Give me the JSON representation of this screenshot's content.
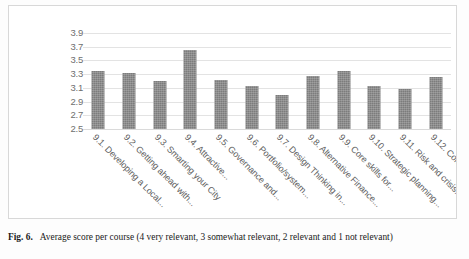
{
  "figure": {
    "caption_label": "Fig. 6.",
    "caption_text": "Average score per course (4 very relevant, 3 somewhat relevant, 2 relevant and 1 not relevant)",
    "ghost_title": "",
    "ghost_legend": ""
  },
  "chart_data": {
    "type": "bar",
    "title": "",
    "xlabel": "",
    "ylabel": "",
    "ylim": [
      2.5,
      3.9
    ],
    "ytick_step": 0.2,
    "grid": true,
    "legend": "none",
    "bar_color": "#7c7c7c",
    "gridline_color": "#e3e3e3",
    "axis_text_color": "#6e6e6e",
    "yticks": [
      "3.9",
      "3.7",
      "3.5",
      "3.3",
      "3.1",
      "2.9",
      "2.7",
      "2.5"
    ],
    "ytick_values": [
      3.9,
      3.7,
      3.5,
      3.3,
      3.1,
      2.9,
      2.7,
      2.5
    ],
    "categories": [
      "9.1. Developing a Local...",
      "9.2. Getting ahead with...",
      "9.3. Smarting your City",
      "9.4. Attractive...",
      "9.5. Governance and...",
      "9.6. Portfolio/system...",
      "9.7. Design Thinking in...",
      "9.8. Alternative Finance...",
      "9.9. Core skills for...",
      "9.10. Strategic planning...",
      "9.11. Risk and crisis...",
      "9.12. Community..."
    ],
    "values": [
      3.35,
      3.32,
      3.2,
      3.65,
      3.21,
      3.13,
      3.0,
      3.28,
      3.35,
      3.13,
      3.08,
      3.26
    ]
  }
}
